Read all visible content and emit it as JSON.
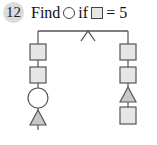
{
  "problem": {
    "number": "12",
    "text_prefix": "Find",
    "text_middle": "if",
    "text_suffix": "= 5",
    "unknown_shape": "circle",
    "given_shape": "square",
    "given_value": 5
  },
  "mobile": {
    "left_column": [
      "square",
      "square",
      "circle",
      "triangle"
    ],
    "right_column": [
      "square",
      "square",
      "triangle",
      "square"
    ]
  },
  "colors": {
    "badge": "#dcdcdc",
    "square_fill": "#e6e6e6",
    "triangle_fill": "#c8c8c8",
    "circle_fill": "#ffffff",
    "stroke": "#555555"
  }
}
